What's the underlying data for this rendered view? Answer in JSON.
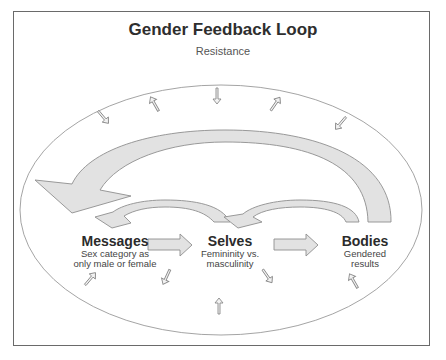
{
  "diagram": {
    "title": "Gender Feedback Loop",
    "subtitle": "Resistance",
    "nodes": [
      {
        "id": "messages",
        "label": "Messages",
        "desc_line1": "Sex category as",
        "desc_line2": "only male or female"
      },
      {
        "id": "selves",
        "label": "Selves",
        "desc_line1": "Femininity vs.",
        "desc_line2": "masculinity"
      },
      {
        "id": "bodies",
        "label": "Bodies",
        "desc_line1": "Gendered",
        "desc_line2": "results"
      }
    ],
    "edges": [
      {
        "from": "messages",
        "to": "selves",
        "type": "block-arrow"
      },
      {
        "from": "selves",
        "to": "bodies",
        "type": "block-arrow"
      },
      {
        "from": "selves",
        "to": "messages",
        "type": "curved-feedback-small"
      },
      {
        "from": "bodies",
        "to": "selves",
        "type": "curved-feedback-small"
      },
      {
        "from": "bodies",
        "to": "messages",
        "type": "curved-feedback-large"
      }
    ],
    "boundary": {
      "shape": "ellipse",
      "meaning": "Resistance",
      "small_arrows": 10
    },
    "colors": {
      "arrow_fill": "#e2e2e2",
      "arrow_stroke": "#9a9a9a",
      "ellipse_stroke": "#9a9a9a",
      "frame": "#6a6a6a",
      "text": "#2e2e2e"
    }
  }
}
